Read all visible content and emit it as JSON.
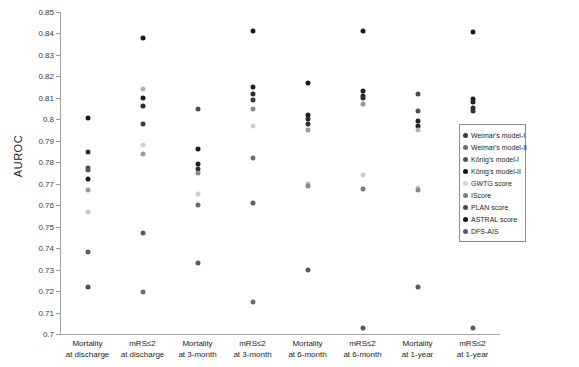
{
  "chart_data": {
    "type": "scatter",
    "title": "",
    "xlabel": "",
    "ylabel": "AUROC",
    "ylim": [
      0.7,
      0.85
    ],
    "ytick_step": 0.01,
    "grid": false,
    "legend_position": "right",
    "ytick_labels": [
      "0.85",
      "0.84",
      "0.83",
      "0.82",
      "0.81",
      "0.8",
      "0.79",
      "0.78",
      "0.77",
      "0.76",
      "0.75",
      "0.74",
      "0.73",
      "0.72",
      "0.71",
      "0.7"
    ],
    "ytick_values": [
      0.85,
      0.84,
      0.83,
      0.82,
      0.81,
      0.8,
      0.79,
      0.78,
      0.77,
      0.76,
      0.75,
      0.74,
      0.73,
      0.72,
      0.71,
      0.7
    ],
    "categories": [
      "Mortality\nat discharge",
      "mRS≤2\nat discharge",
      "Mortality\nat 3-month",
      "mRS≤2\nat 3-month",
      "Mortality\nat 6-month",
      "mRS≤2\nat 6-month",
      "Mortality\nat 1-year",
      "mRS≤2\nat 1-year"
    ],
    "category_lines": [
      [
        "Mortality",
        "at discharge"
      ],
      [
        "mRS≤2",
        "at discharge"
      ],
      [
        "Mortality",
        "at 3-month"
      ],
      [
        "mRS≤2",
        "at 3-month"
      ],
      [
        "Mortality",
        "at 6-month"
      ],
      [
        "mRS≤2",
        "at 6-month"
      ],
      [
        "Mortality",
        "at 1-year"
      ],
      [
        "mRS≤2",
        "at 1-year"
      ]
    ],
    "series": [
      {
        "name": "Weimar's model-I",
        "color": "#2b2b2b",
        "values": [
          0.772,
          0.814,
          0.779,
          0.815,
          0.8,
          0.813,
          0.804,
          0.8095
        ]
      },
      {
        "name": "Weimar's model-II",
        "color": "#3f3f3f",
        "values": [
          0.7775,
          0.809,
          0.777,
          0.812,
          0.798,
          0.811,
          0.799,
          0.8055
        ]
      },
      {
        "name": "König's model-I",
        "color": "#5a5a5a",
        "values": [
          0.785,
          0.806,
          0.805,
          0.809,
          0.802,
          0.81,
          0.797,
          0.808
        ]
      },
      {
        "name": "König's model-II",
        "color": "#1a1a1a",
        "values": [
          0.8005,
          0.838,
          0.786,
          0.841,
          0.817,
          0.841,
          0.812,
          0.8405
        ]
      },
      {
        "name": "GWTG score",
        "color": "#cfcfcf",
        "values": [
          0.757,
          0.788,
          0.765,
          0.797,
          0.77,
          0.774,
          0.768,
          0.764
        ]
      },
      {
        "name": "IScore",
        "color": "#a0a0a0",
        "values": [
          0.767,
          0.784,
          0.775,
          0.805,
          0.769,
          0.807,
          0.767,
          0.8045
        ]
      },
      {
        "name": "PLAN score",
        "color": "#8c8c8c",
        "values": [
          0.7765,
          0.798,
          0.777,
          0.782,
          0.795,
          0.7675,
          0.795,
          0.804
        ]
      },
      {
        "name": "ASTRAL score",
        "color": "#4a4a4a",
        "values": [
          0.738,
          0.747,
          0.76,
          0.761,
          0.73,
          0.703,
          0.722,
          0.703
        ]
      },
      {
        "name": "DFS-AIS",
        "color": "#6e6e6e",
        "values": [
          0.722,
          0.7195,
          0.733,
          0.715,
          0.73,
          0.703,
          0.722,
          0.703
        ]
      }
    ],
    "points": [
      {
        "category": 0,
        "value": 0.8005,
        "series": "König's model-II",
        "color": "#1a1a1a"
      },
      {
        "category": 0,
        "value": 0.785,
        "series": "König's model-I",
        "color": "#2b2b2b"
      },
      {
        "category": 0,
        "value": 0.7775,
        "series": "Weimar's model-II",
        "color": "#3f3f3f"
      },
      {
        "category": 0,
        "value": 0.7765,
        "series": "PLAN score",
        "color": "#5d5d5d"
      },
      {
        "category": 0,
        "value": 0.772,
        "series": "Weimar's model-I",
        "color": "#1f1f1f"
      },
      {
        "category": 0,
        "value": 0.767,
        "series": "IScore",
        "color": "#9a9a9a"
      },
      {
        "category": 0,
        "value": 0.757,
        "series": "GWTG score",
        "color": "#cacaca"
      },
      {
        "category": 0,
        "value": 0.738,
        "series": "ASTRAL score",
        "color": "#5a5a5a"
      },
      {
        "category": 0,
        "value": 0.722,
        "series": "DFS-AIS",
        "color": "#4f4f4f"
      },
      {
        "category": 1,
        "value": 0.838,
        "series": "König's model-II",
        "color": "#1a1a1a"
      },
      {
        "category": 1,
        "value": 0.814,
        "series": "Weimar's model-I",
        "color": "#b4b4b4"
      },
      {
        "category": 1,
        "value": 0.81,
        "series": "König's model-I",
        "color": "#1f1f1f"
      },
      {
        "category": 1,
        "value": 0.806,
        "series": "Weimar's model-II",
        "color": "#2b2b2b"
      },
      {
        "category": 1,
        "value": 0.798,
        "series": "PLAN score",
        "color": "#3d3d3d"
      },
      {
        "category": 1,
        "value": 0.788,
        "series": "GWTG score",
        "color": "#d2d2d2"
      },
      {
        "category": 1,
        "value": 0.784,
        "series": "IScore",
        "color": "#9a9a9a"
      },
      {
        "category": 1,
        "value": 0.747,
        "series": "ASTRAL score",
        "color": "#5a5a5a"
      },
      {
        "category": 1,
        "value": 0.7195,
        "series": "DFS-AIS",
        "color": "#6b6b6b"
      },
      {
        "category": 2,
        "value": 0.805,
        "series": "König's model-I",
        "color": "#4a4a4a"
      },
      {
        "category": 2,
        "value": 0.786,
        "series": "König's model-II",
        "color": "#1a1a1a"
      },
      {
        "category": 2,
        "value": 0.779,
        "series": "Weimar's model-I",
        "color": "#1f1f1f"
      },
      {
        "category": 2,
        "value": 0.777,
        "series": "Weimar's model-II",
        "color": "#2e2e2e"
      },
      {
        "category": 2,
        "value": 0.775,
        "series": "PLAN score",
        "color": "#8a8a8a"
      },
      {
        "category": 2,
        "value": 0.765,
        "series": "GWTG score",
        "color": "#cacaca"
      },
      {
        "category": 2,
        "value": 0.76,
        "series": "IScore",
        "color": "#6e6e6e"
      },
      {
        "category": 2,
        "value": 0.733,
        "series": "DFS-AIS",
        "color": "#5a5a5a"
      },
      {
        "category": 3,
        "value": 0.841,
        "series": "König's model-II",
        "color": "#1a1a1a"
      },
      {
        "category": 3,
        "value": 0.815,
        "series": "Weimar's model-I",
        "color": "#1f1f1f"
      },
      {
        "category": 3,
        "value": 0.812,
        "series": "Weimar's model-II",
        "color": "#2b2b2b"
      },
      {
        "category": 3,
        "value": 0.809,
        "series": "König's model-I",
        "color": "#3a3a3a"
      },
      {
        "category": 3,
        "value": 0.805,
        "series": "IScore",
        "color": "#8a8a8a"
      },
      {
        "category": 3,
        "value": 0.797,
        "series": "GWTG score",
        "color": "#cfcfcf"
      },
      {
        "category": 3,
        "value": 0.782,
        "series": "PLAN score",
        "color": "#6e6e6e"
      },
      {
        "category": 3,
        "value": 0.761,
        "series": "ASTRAL score",
        "color": "#5a5a5a"
      },
      {
        "category": 3,
        "value": 0.715,
        "series": "DFS-AIS",
        "color": "#6b6b6b"
      },
      {
        "category": 4,
        "value": 0.817,
        "series": "König's model-II",
        "color": "#1a1a1a"
      },
      {
        "category": 4,
        "value": 0.802,
        "series": "König's model-I",
        "color": "#1f1f1f"
      },
      {
        "category": 4,
        "value": 0.8,
        "series": "Weimar's model-I",
        "color": "#2b2b2b"
      },
      {
        "category": 4,
        "value": 0.798,
        "series": "Weimar's model-II",
        "color": "#2e2e2e"
      },
      {
        "category": 4,
        "value": 0.795,
        "series": "PLAN score",
        "color": "#9a9a9a"
      },
      {
        "category": 4,
        "value": 0.77,
        "series": "GWTG score",
        "color": "#bdbdbd"
      },
      {
        "category": 4,
        "value": 0.769,
        "series": "IScore",
        "color": "#8a8a8a"
      },
      {
        "category": 4,
        "value": 0.73,
        "series": "ASTRAL score",
        "color": "#5a5a5a"
      },
      {
        "category": 5,
        "value": 0.841,
        "series": "König's model-II",
        "color": "#1a1a1a"
      },
      {
        "category": 5,
        "value": 0.813,
        "series": "Weimar's model-I",
        "color": "#1f1f1f"
      },
      {
        "category": 5,
        "value": 0.811,
        "series": "Weimar's model-II",
        "color": "#242424"
      },
      {
        "category": 5,
        "value": 0.81,
        "series": "König's model-I",
        "color": "#2e2e2e"
      },
      {
        "category": 5,
        "value": 0.807,
        "series": "IScore",
        "color": "#9a9a9a"
      },
      {
        "category": 5,
        "value": 0.774,
        "series": "GWTG score",
        "color": "#cacaca"
      },
      {
        "category": 5,
        "value": 0.7675,
        "series": "PLAN score",
        "color": "#7a7a7a"
      },
      {
        "category": 5,
        "value": 0.703,
        "series": "ASTRAL score",
        "color": "#5a5a5a"
      },
      {
        "category": 6,
        "value": 0.812,
        "series": "König's model-II",
        "color": "#4a4a4a"
      },
      {
        "category": 6,
        "value": 0.804,
        "series": "Weimar's model-I",
        "color": "#4f4f4f"
      },
      {
        "category": 6,
        "value": 0.799,
        "series": "Weimar's model-II",
        "color": "#1f1f1f"
      },
      {
        "category": 6,
        "value": 0.797,
        "series": "König's model-I",
        "color": "#242424"
      },
      {
        "category": 6,
        "value": 0.795,
        "series": "PLAN score",
        "color": "#b4b4b4"
      },
      {
        "category": 6,
        "value": 0.768,
        "series": "GWTG score",
        "color": "#cacaca"
      },
      {
        "category": 6,
        "value": 0.767,
        "series": "IScore",
        "color": "#8a8a8a"
      },
      {
        "category": 6,
        "value": 0.722,
        "series": "ASTRAL score",
        "color": "#5a5a5a"
      },
      {
        "category": 7,
        "value": 0.8405,
        "series": "König's model-II",
        "color": "#1a1a1a"
      },
      {
        "category": 7,
        "value": 0.8095,
        "series": "Weimar's model-I",
        "color": "#1f1f1f"
      },
      {
        "category": 7,
        "value": 0.808,
        "series": "König's model-I",
        "color": "#242424"
      },
      {
        "category": 7,
        "value": 0.8055,
        "series": "Weimar's model-II",
        "color": "#2b2b2b"
      },
      {
        "category": 7,
        "value": 0.804,
        "series": "PLAN score",
        "color": "#333333"
      },
      {
        "category": 7,
        "value": 0.764,
        "series": "GWTG score",
        "color": "#8a8a8a"
      },
      {
        "category": 7,
        "value": 0.703,
        "series": "ASTRAL score",
        "color": "#5a5a5a"
      }
    ]
  },
  "legend": {
    "items": [
      {
        "label": "Weimar's model-I",
        "color": "#3a3a3a"
      },
      {
        "label": "Weimar's model-II",
        "color": "#6e6e6e"
      },
      {
        "label": "König's model-I",
        "color": "#555555"
      },
      {
        "label": "König's model-II",
        "color": "#141414"
      },
      {
        "label": "GWTG score",
        "color": "#d4d4d4"
      },
      {
        "label": "IScore",
        "color": "#7d7d7d"
      },
      {
        "label": "PLAN score",
        "color": "#4a4a4a"
      },
      {
        "label": "ASTRAL score",
        "color": "#141414"
      },
      {
        "label": "DFS-AIS",
        "color": "#5e5e5e"
      }
    ]
  }
}
